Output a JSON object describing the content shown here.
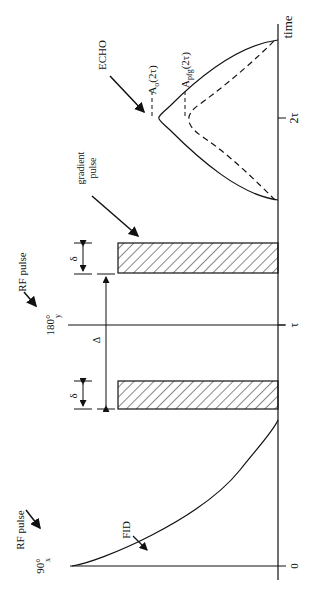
{
  "figure": {
    "orientation": "rotated 90 degrees counterclockwise",
    "colors": {
      "ink": "#111111",
      "background": "#ffffff"
    }
  },
  "axis": {
    "label": "time",
    "ticks": [
      {
        "label": "0",
        "pos": 566
      },
      {
        "label": "τ",
        "pos": 325
      },
      {
        "label": "2τ",
        "pos": 118
      }
    ]
  },
  "pulses": {
    "rf_90": {
      "angle": "90°",
      "sub": "x",
      "caption": "RF pulse"
    },
    "rf_180": {
      "angle": "180°",
      "sub": "y",
      "caption": "RF pulse"
    }
  },
  "gradient": {
    "caption_line1": "gradient",
    "caption_line2": "pulse",
    "delta_small": "δ",
    "delta_big": "Δ"
  },
  "signals": {
    "fid_label": "FID",
    "echo_label": "ECHO",
    "a0_label": "A",
    "a0_sub": "o",
    "a0_arg": "(2τ)",
    "apfg_label": "A",
    "apfg_sub": "pfg",
    "apfg_arg": "(2τ)"
  }
}
